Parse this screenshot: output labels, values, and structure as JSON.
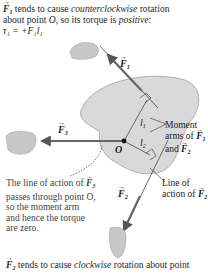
{
  "caption_top": {
    "line1_vector": "F",
    "line1_sub": "1",
    "line1_a": " tends to cause ",
    "line1_em": "counterclockwise",
    "line1_b": " rotation",
    "line2_a": "about point ",
    "line2_point": "O",
    "line2_b": ", so its torque is ",
    "line2_em": "positive",
    "line2_c": ":",
    "line3": "τ₁ = +F₁l₁"
  },
  "labels": {
    "F1": "F",
    "F1_sub": "1",
    "F2": "F",
    "F2_sub": "2",
    "F3": "F",
    "F3_sub": "3",
    "O": "O",
    "l1": "l",
    "l1_sub": "1",
    "l2": "l",
    "l2_sub": "2",
    "moment_arms_line1": "Moment",
    "moment_arms_line2": "arms of ",
    "moment_arms_line3": "and ",
    "line_of_action_line1": "Line of",
    "line_of_action_line2": "action of "
  },
  "note_F3": {
    "line1_a": "The line of action of ",
    "line2": "passes through point O,",
    "line3": "so the moment arm",
    "line4": "and hence the torque",
    "line5": "are zero."
  },
  "caption_bottom": {
    "vector": "F",
    "sub": "2",
    "a": " tends to cause ",
    "em": "clockwise",
    "b": " rotation about point"
  },
  "colors": {
    "body_fill": "#d9d9d9",
    "body_stroke": "#9a9a9a",
    "arrow": "#555555",
    "hand": "#c8c8c8"
  }
}
